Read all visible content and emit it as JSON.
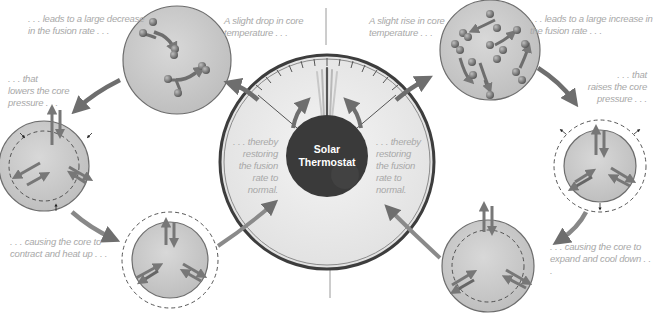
{
  "diagram": {
    "center": {
      "title_line1": "Solar",
      "title_line2": "Thermostat",
      "left_note": [
        ". . . thereby",
        "restoring",
        "the fusion",
        "rate to",
        "normal."
      ],
      "right_note": [
        ". . . thereby",
        "restoring",
        "the fusion",
        "rate to",
        "normal."
      ]
    },
    "left_cycle": {
      "start": [
        "A slight drop in core",
        "temperature . . ."
      ],
      "step1": [
        ". . . leads to a large decrease",
        "in the fusion rate . . ."
      ],
      "step2": [
        ". . . that",
        "lowers the core",
        "pressure . . ."
      ],
      "step3": [
        ". . . causing the core to",
        "contract and heat up . . ."
      ]
    },
    "right_cycle": {
      "start": [
        "A slight rise in core",
        "temperature . . ."
      ],
      "step1": [
        ". . . leads to a large increase in",
        "the fusion rate . . ."
      ],
      "step2": [
        ". . . that",
        "raises the core",
        "pressure . . ."
      ],
      "step3": [
        ". . . causing the core to",
        "expand and cool down . . ."
      ]
    },
    "colors": {
      "circle_fill": "#c9c9c9",
      "circle_stroke": "#6d6d6d",
      "arrow": "#6e6e6e",
      "caption_text": "#a8a8a8",
      "center_dark": "#3a3a3a",
      "dial_face": "#ececec"
    }
  }
}
